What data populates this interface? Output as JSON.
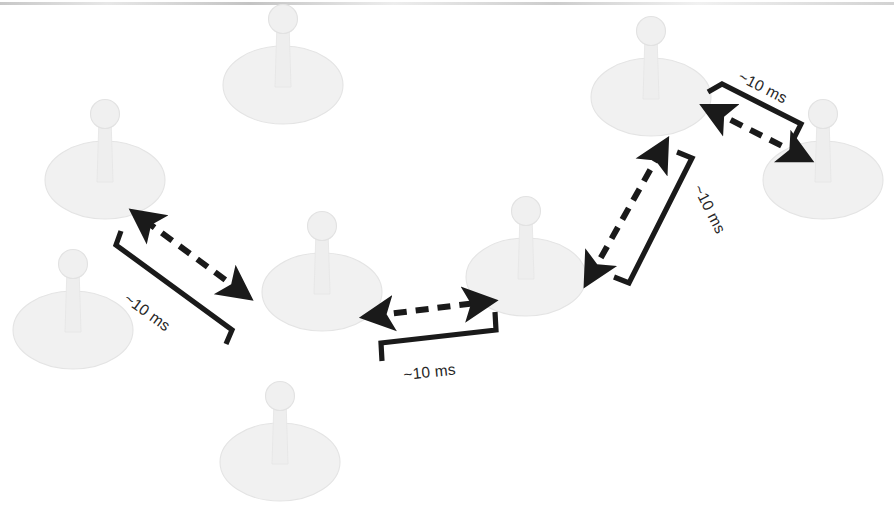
{
  "figure": {
    "background_color": "#ffffff",
    "width": 894,
    "height": 532,
    "ink_color": "#1a1a1a",
    "pin_color": "#f1f1f1"
  },
  "nodes": [
    {
      "id": "node-top-left-far",
      "label": "",
      "cx": 105,
      "cy": 180,
      "highlighted": false
    },
    {
      "id": "node-top-center",
      "label": "",
      "cx": 283,
      "cy": 85,
      "highlighted": false
    },
    {
      "id": "node-left-lower",
      "label": "",
      "cx": 73,
      "cy": 330,
      "highlighted": false
    },
    {
      "id": "node-bottom-center",
      "label": "",
      "cx": 280,
      "cy": 462,
      "highlighted": false
    },
    {
      "id": "node-chain-1",
      "label": "",
      "cx": 322,
      "cy": 292,
      "highlighted": true
    },
    {
      "id": "node-chain-2",
      "label": "",
      "cx": 526,
      "cy": 277,
      "highlighted": true
    },
    {
      "id": "node-chain-3",
      "label": "",
      "cx": 651,
      "cy": 97,
      "highlighted": true
    },
    {
      "id": "node-chain-4",
      "label": "",
      "cx": 823,
      "cy": 180,
      "highlighted": true
    }
  ],
  "connections": [
    {
      "id": "link-left",
      "label": "~10 ms",
      "from": "node-chain-1",
      "to": "node-top-left-far",
      "arrow": "double",
      "style": "dashed",
      "orientation": "diagonal-up-left"
    },
    {
      "id": "link-center",
      "label": "~10 ms",
      "from": "node-chain-1",
      "to": "node-chain-2",
      "arrow": "double",
      "style": "dashed",
      "orientation": "horizontal"
    },
    {
      "id": "link-right-up",
      "label": "~10 ms",
      "from": "node-chain-2",
      "to": "node-chain-3",
      "arrow": "double",
      "style": "dashed",
      "orientation": "diagonal-up-right"
    },
    {
      "id": "link-far-right",
      "label": "~10 ms",
      "from": "node-chain-3",
      "to": "node-chain-4",
      "arrow": "double",
      "style": "dashed",
      "orientation": "diagonal-down-right"
    }
  ],
  "labels": {
    "latency_left": "~10 ms",
    "latency_center": "~10 ms",
    "latency_right_up": "~10 ms",
    "latency_far_right": "~10 ms"
  }
}
